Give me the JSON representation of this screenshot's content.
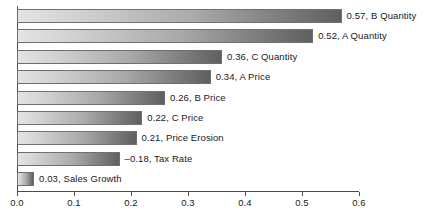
{
  "chart_data": {
    "type": "bar",
    "orientation": "horizontal",
    "title": "",
    "xlabel": "",
    "ylabel": "",
    "xlim": [
      0.0,
      0.6
    ],
    "xticks": [
      "0.0",
      "0.1",
      "0.2",
      "0.3",
      "0.4",
      "0.5",
      "0.6"
    ],
    "xtick_values": [
      0.0,
      0.1,
      0.2,
      0.3,
      0.4,
      0.5,
      0.6
    ],
    "grid": false,
    "legend": "none",
    "categories": [
      "B Quantity",
      "A Quantity",
      "C Quantity",
      "A Price",
      "B Price",
      "C Price",
      "Price Erosion",
      "Tax Rate",
      "Sales Growth"
    ],
    "values": [
      0.57,
      0.52,
      0.36,
      0.34,
      0.26,
      0.22,
      0.21,
      -0.18,
      0.03
    ],
    "bar_labels": [
      "0.57, B Quantity",
      "0.52, A Quantity",
      "0.36, C Quantity",
      "0.34, A Price",
      "0.26, B Price",
      "0.22, C Price",
      "0.21, Price Erosion",
      "–0.18, Tax Rate",
      "0.03, Sales Growth"
    ],
    "bars": [
      {
        "label": "0.57, B Quantity",
        "category": "B Quantity",
        "value": 0.57,
        "magnitude": 0.57
      },
      {
        "label": "0.52, A Quantity",
        "category": "A Quantity",
        "value": 0.52,
        "magnitude": 0.52
      },
      {
        "label": "0.36, C Quantity",
        "category": "C Quantity",
        "value": 0.36,
        "magnitude": 0.36
      },
      {
        "label": "0.34, A Price",
        "category": "A Price",
        "value": 0.34,
        "magnitude": 0.34
      },
      {
        "label": "0.26, B Price",
        "category": "B Price",
        "value": 0.26,
        "magnitude": 0.26
      },
      {
        "label": "0.22, C Price",
        "category": "C Price",
        "value": 0.22,
        "magnitude": 0.22
      },
      {
        "label": "0.21, Price Erosion",
        "category": "Price Erosion",
        "value": 0.21,
        "magnitude": 0.21
      },
      {
        "label": "–0.18, Tax Rate",
        "category": "Tax Rate",
        "value": -0.18,
        "magnitude": 0.18
      },
      {
        "label": "0.03, Sales Growth",
        "category": "Sales Growth",
        "value": 0.03,
        "magnitude": 0.03
      }
    ]
  },
  "style": {
    "bar_fill_light": "#e3e3e3",
    "bar_fill_dark": "#5f5f5f",
    "bar_border": "#6f6f6f",
    "axis_color": "#4c4c4c",
    "text_color": "#1a1a1a",
    "background": "#ffffff"
  },
  "geometry": {
    "x_origin_px": 17,
    "x_end_px": 359,
    "px_per_unit": 569.5,
    "bar_height_px": 14,
    "row_pitch_px": 20.4,
    "first_row_top_px": 9,
    "axis_y_px": 191,
    "label_gap_px": 5
  }
}
